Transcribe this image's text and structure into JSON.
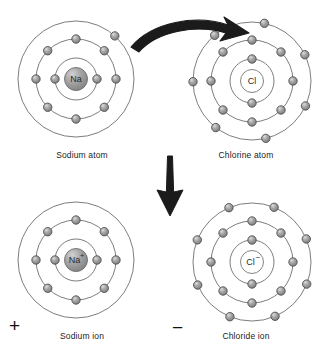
{
  "figure": {
    "type": "diagram",
    "background_color": "#ffffff",
    "line_color": "#6e6e6e",
    "arrow_color": "#1a1a1a",
    "electron_color": "#9a9a9a",
    "electron_edge_color": "#4a4a4a",
    "nucleus_filled_color": "#9e9e9e",
    "nucleus_empty_color": "#ffffff"
  },
  "panels": [
    {
      "id": "sodium-atom",
      "caption": "Sodium atom",
      "nucleus_label": "Na",
      "nucleus_style": "filled",
      "center": {
        "x": 76,
        "y": 79
      },
      "shells": [
        {
          "radius": 21,
          "electrons": 2,
          "start_angle": 0,
          "label": "inner-shell"
        },
        {
          "radius": 40,
          "electrons": 8,
          "start_angle": 0,
          "label": "middle-shell"
        },
        {
          "radius": 58,
          "electrons": 1,
          "start_angle": -48,
          "label": "outer-shell"
        }
      ],
      "charge_symbol": ""
    },
    {
      "id": "chlorine-atom",
      "caption": "Chlorine atom",
      "nucleus_label": "Cl",
      "nucleus_style": "empty",
      "center": {
        "x": 252,
        "y": 81
      },
      "shells": [
        {
          "radius": 22,
          "electrons": 2,
          "start_angle": 90,
          "label": "inner-shell"
        },
        {
          "radius": 41,
          "electrons": 8,
          "start_angle": 0,
          "label": "middle-shell"
        },
        {
          "radius": 59,
          "electrons": 7,
          "start_angle": 25,
          "label": "outer-shell"
        }
      ],
      "charge_symbol": ""
    },
    {
      "id": "sodium-ion",
      "caption": "Sodium ion",
      "nucleus_label": "Na",
      "nucleus_superscript": "+",
      "nucleus_style": "filled",
      "center": {
        "x": 76,
        "y": 260
      },
      "shells": [
        {
          "radius": 21,
          "electrons": 2,
          "start_angle": 0,
          "label": "inner-shell"
        },
        {
          "radius": 40,
          "electrons": 8,
          "start_angle": 0,
          "label": "middle-shell"
        },
        {
          "radius": 58,
          "electrons": 0,
          "start_angle": 0,
          "label": "outer-shell-empty"
        }
      ],
      "charge_symbol": "+"
    },
    {
      "id": "chloride-ion",
      "caption": "Chloride ion",
      "nucleus_label": "Cl",
      "nucleus_superscript": "−",
      "nucleus_style": "empty",
      "center": {
        "x": 252,
        "y": 262
      },
      "shells": [
        {
          "radius": 22,
          "electrons": 2,
          "start_angle": 90,
          "label": "inner-shell"
        },
        {
          "radius": 41,
          "electrons": 8,
          "start_angle": 0,
          "label": "middle-shell"
        },
        {
          "radius": 59,
          "electrons": 8,
          "start_angle": 22,
          "label": "outer-shell"
        }
      ],
      "charge_symbol": "−"
    }
  ],
  "arrows": [
    {
      "id": "electron-transfer-arrow",
      "style": "curved",
      "description": "Curved arrow from sodium outer electron to chlorine outer shell"
    },
    {
      "id": "reaction-down-arrow",
      "style": "straight-down",
      "description": "Thick downward arrow indicating formation of ions"
    }
  ]
}
